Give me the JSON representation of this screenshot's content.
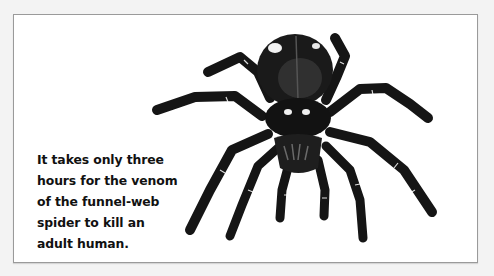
{
  "illustration": {
    "subject": "funnel-web spider",
    "icon": "spider-illustration",
    "colors": {
      "background": "#f3f3f3",
      "panel": "#ffffff",
      "panel_border": "#9a9a9a",
      "spider_dark": "#151515",
      "spider_mid": "#3a3a3a",
      "highlight": "#ffffff"
    }
  },
  "caption": {
    "lines": [
      "It takes only three",
      "hours for the venom",
      "of the funnel-web",
      "spider to kill an",
      "adult human."
    ]
  }
}
